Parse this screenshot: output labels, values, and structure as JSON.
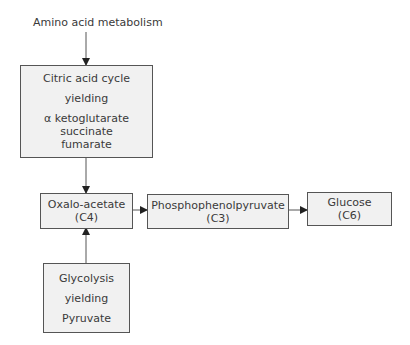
{
  "diagram": {
    "input_label": "Amino acid metabolism",
    "nodes": {
      "citric": {
        "lines": [
          "Citric acid cycle",
          "yielding",
          "α ketoglutarate",
          "succinate",
          "fumarate"
        ]
      },
      "oxalo": {
        "lines": [
          "Oxalo-acetate",
          "(C4)"
        ]
      },
      "pep": {
        "lines": [
          "Phosphophenolpyruvate",
          "(C3)"
        ]
      },
      "glucose": {
        "lines": [
          "Glucose",
          "(C6)"
        ]
      },
      "glycolysis": {
        "lines": [
          "Glycolysis",
          "yielding",
          "Pyruvate"
        ]
      }
    },
    "edges": [
      {
        "from": "Amino acid metabolism",
        "to": "Citric acid cycle"
      },
      {
        "from": "Citric acid cycle",
        "to": "Oxalo-acetate"
      },
      {
        "from": "Glycolysis",
        "to": "Oxalo-acetate"
      },
      {
        "from": "Oxalo-acetate",
        "to": "Phosphophenolpyruvate"
      },
      {
        "from": "Phosphophenolpyruvate",
        "to": "Glucose"
      }
    ],
    "colors": {
      "box_fill": "#f1f1f1",
      "border": "#555555",
      "text": "#3a3a3a"
    }
  }
}
